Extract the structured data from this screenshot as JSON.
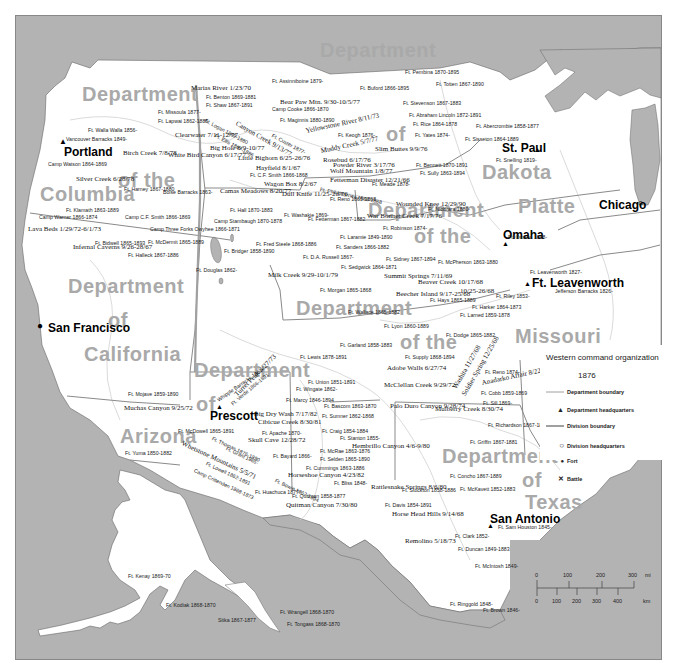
{
  "map": {
    "title": "Western command organization",
    "year": "1876",
    "colors": {
      "water": "#b3b3b3",
      "land": "#ffffff",
      "dept_label": "#a9a9a9",
      "boundary": "#8a8a8a",
      "division_boundary": "#a0a0a0",
      "river": "#cfcfcf"
    },
    "departments": [
      {
        "line1": "Department",
        "line2": "of the",
        "line3": "Columbia"
      },
      {
        "line1": "Department",
        "line2": "of",
        "line3": "California"
      },
      {
        "line1": "Department",
        "line2": "of",
        "line3": "Arizona"
      },
      {
        "line1": "Department",
        "line2": "of",
        "line3": "Dakota"
      },
      {
        "line1": "Department",
        "line2": "of the",
        "line3": "Platte"
      },
      {
        "line1": "Department",
        "line2": "of the",
        "line3": "Missouri"
      },
      {
        "line1": "Department",
        "line2": "of",
        "line3": "Texas"
      }
    ],
    "cities": {
      "portland": "Portland",
      "san_francisco": "San Francisco",
      "prescott": "Prescott",
      "st_paul": "St. Paul",
      "omaha": "Omaha",
      "chicago": "Chicago",
      "ft_leavenworth": "Ft. Leavenworth",
      "san_antonio": "San Antonio"
    },
    "forts": [
      "Ft. Walla Walla 1856-",
      "Vancouver Barracks 1849-",
      "Camp Watson 1864-1869",
      "Ft. Harney 1867-1880",
      "Boise Barracks 1863-",
      "Ft. Klamath 1863-1889",
      "Camp Warner 1866-1874",
      "Camp C.F. Smith 1866-1869",
      "Camp Three Forks Owyhee 1866-1871",
      "Ft. Bidwell 1865-1893",
      "Ft. McDermit 1865-1889",
      "Ft. Halleck 1867-1886",
      "Ft. Missoula 1877-",
      "Ft. Lapwai 1862-1885",
      "Ft. Benton 1869-1881",
      "Ft. Shaw 1867-1891",
      "Ft. Logan 1869-1880",
      "Ft. Ellis 1867-1886",
      "Ft. Assinniboine 1879-",
      "Camp Cooke 1866-1870",
      "Ft. Maginnis 1880-1890",
      "Ft. Custer 1877-",
      "Ft. Keogh 1876-",
      "Ft. C.F. Smith 1866-1868",
      "Ft. Phil Kearney 1866-1868",
      "Ft. Reno 1865-1868",
      "Ft. Meade 1878-",
      "Ft. Hall 1870-1883",
      "Camp Stambaugh 1870-1878",
      "Ft. Washakie 1869-",
      "Ft. Fetterman 1867-1882",
      "Ft. Bridger 1858-1890",
      "Ft. Douglas 1862-",
      "Ft. Fred Steele 1868-1886",
      "Ft. Laramie 1849-1890",
      "Ft. Sanders 1866-1882",
      "Ft. D.A. Russell 1867-",
      "Ft. Robinson 1874-",
      "Ft. Sidney 1867-1894",
      "Ft. McPherson 1863-1880",
      "Ft. Sedgwick 1864-1871",
      "Ft. Pembina 1870-1895",
      "Ft. Totten 1867-1890",
      "Ft. Buford 1866-1895",
      "Ft. Stevenson 1867-1883",
      "Ft. Abraham Lincoln 1872-1891",
      "Ft. Rice 1864-1878",
      "Ft. Yates 1874-",
      "Ft. Abercrombie 1858-1877",
      "Ft. Sisseton 1864-1889",
      "Ft. Snelling 1819-",
      "Ft. Bennett 1870-1891",
      "Ft. Sully 1863-1894",
      "Ft. Niobrara 1880-",
      "Ft. Omaha 1868-",
      "Ft. Leavenworth 1827-",
      "Jefferson Barracks 1826-",
      "Ft. Morgan 1865-1868",
      "Ft. Wallace 1865-1882",
      "Ft. Hays 1865-1889",
      "Ft. Harker 1864-1873",
      "Ft. Riley 1853-",
      "Ft. Lyon 1860-1889",
      "Ft. Larned 1859-1878",
      "Ft. Dodge 1865-1882",
      "Ft. Garland 1858-1883",
      "Ft. Lewis 1878-1891",
      "Ft. Supply 1868-1894",
      "Ft. Reno 1874-",
      "Ft. Cobb 1859-1869",
      "Ft. Sill 1869-",
      "Ft. Union 1851-1891",
      "Ft. Wingate 1862-",
      "Ft. Marcy 1846-1894",
      "Ft. Bascom 1863-1870",
      "Ft. Sumner 1862-1868",
      "Ft. Craig 1854-1884",
      "Ft. Stanton 1855-",
      "Ft. McRae 1863-1876",
      "Ft. Selden 1865-1890",
      "Ft. Cummings 1863-1886",
      "Ft. Bayard 1866-",
      "Ft. Bowie 1862-1894",
      "Ft. Bliss 1848-",
      "Ft. Quitman 1858-1877",
      "Ft. Huachuca 1877-",
      "Ft. Mojave 1859-1890",
      "Ft. Yuma 1850-1882",
      "Whipple Barracks 1863-",
      "Ft. Verde 1866-1891",
      "Ft. McDowell 1865-1891",
      "Ft. Apache 1870-",
      "Ft. Thomas 1876-1890",
      "Ft. Grant 1865-",
      "Ft. Lowell 1862-1891",
      "Camp Crittenden 1868-1873",
      "Ft. Richardson 1867-1878",
      "Ft. Griffin 1867-1881",
      "Ft. Concho 1867-1889",
      "Ft. Stockton 1858-1886",
      "Ft. McKavett 1852-1883",
      "Ft. Davis 1854-1891",
      "Ft. Clark 1852-",
      "Ft. Sam Houston 1845-",
      "Ft. Duncan 1849-1883",
      "Ft. McIntosh 1849-",
      "Ft. Ringgold 1848-",
      "Ft. Brown 1846-",
      "Ft. Kenay 1869-70",
      "Ft. Kodiak 1868-1870",
      "Sitka 1867-1877",
      "Ft. Wrangell 1868-1870",
      "Ft. Tongass 1868-1870"
    ],
    "battles": [
      "Birch Creek 7/8/78",
      "Silver Creek 6/28/78",
      "Clearwater 7/11-12/77",
      "White Bird Canyon 6/17/77",
      "Big Hole 8/9-10/77",
      "Camas Meadows 8/20/77",
      "Lava Beds 1/29/72-6/1/73",
      "Infernal Caverns 9/26-28/67",
      "Marias River 1/23/70",
      "Bear Paw Mtn. 9/30-10/5/77",
      "Canyon Creek 9/13/77",
      "Little Bighorn 6/25-26/76",
      "Yellowstone River 8/11/73",
      "Muddy Creek 5/7/77",
      "Rosebud 6/17/76",
      "Powder River 3/17/76",
      "Slim Buttes 9/9/76",
      "Hayfield 8/1/67",
      "Wolf Mountain 1/8/77",
      "Fetterman Disaster 12/21/66",
      "Wagon Box 8/2/67",
      "Dull Knife 11/25-26/76",
      "Wounded Knee 12/29/90",
      "War Bonnet Creek 7/17/76",
      "Milk Creek 9/29-10/1/79",
      "Summit Springs 7/11/69",
      "Beaver Creek 10/17/68",
      "10/25-26/68",
      "Beecher Island 9/17-25/68",
      "Adobe Walls 6/27/74",
      "McClellan Creek 9/29/72",
      "Palo Duro Canyon 9/28/74",
      "Mulberry Creek 8/30/74",
      "Washita 11/27/68",
      "Soldier Spring 12/25/68",
      "Anadarko Affair 8/22-23/74",
      "Muchas Canyon 9/25/72",
      "Turret Peak 3/27/73",
      "Big Dry Wash 7/17/82",
      "Cibicue Creek 8/30/81",
      "Skull Cave 12/28/72",
      "Whetstone Mountains 5/5/71",
      "Hembrillo Canyon 4/6-9/80",
      "Horseshoe Canyon 4/23/82",
      "Quitman Canyon 7/30/80",
      "Rattlesnake Springs 8/6/80",
      "Horse Head Hills 9/14/68",
      "Remolino 5/18/73"
    ],
    "legend": {
      "items": [
        {
          "label": "Department boundary",
          "symbol": "thin-line"
        },
        {
          "label": "Department headquarters",
          "symbol": "triangle"
        },
        {
          "label": "Division boundary",
          "symbol": "thick-line"
        },
        {
          "label": "Division headquarters",
          "symbol": "circle"
        },
        {
          "label": "Fort",
          "symbol": "dot"
        },
        {
          "label": "Battle",
          "symbol": "x"
        }
      ]
    },
    "scale": {
      "mi_ticks": [
        "0",
        "100",
        "200",
        "300"
      ],
      "mi_unit": "mi",
      "km_ticks": [
        "0",
        "100",
        "200",
        "300",
        "400"
      ],
      "km_unit": "km"
    }
  }
}
